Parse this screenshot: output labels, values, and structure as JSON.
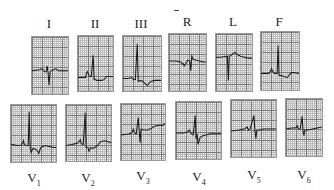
{
  "figure": {
    "rows": [
      {
        "name": "limb-leads",
        "leads": [
          {
            "label": "I",
            "base": "I",
            "sub": ""
          },
          {
            "label": "II",
            "base": "II",
            "sub": ""
          },
          {
            "label": "III",
            "base": "III",
            "sub": ""
          },
          {
            "label": "R",
            "base": "R",
            "sub": ""
          },
          {
            "label": "L",
            "base": "L",
            "sub": ""
          },
          {
            "label": "F",
            "base": "F",
            "sub": ""
          }
        ]
      },
      {
        "name": "precordial-leads",
        "leads": [
          {
            "label": "V1",
            "base": "V",
            "sub": "1"
          },
          {
            "label": "V2",
            "base": "V",
            "sub": "2"
          },
          {
            "label": "V3",
            "base": "V",
            "sub": "3"
          },
          {
            "label": "V4",
            "base": "V",
            "sub": "4"
          },
          {
            "label": "V5",
            "base": "V",
            "sub": "5"
          },
          {
            "label": "V6",
            "base": "V",
            "sub": "6"
          }
        ]
      }
    ],
    "colors": {
      "trace": "#1a1a1a",
      "grid_major": "#7a7a7a",
      "grid_minor": "#bdbdbd",
      "paper": "#f4f4f4",
      "label": "#222222"
    }
  }
}
